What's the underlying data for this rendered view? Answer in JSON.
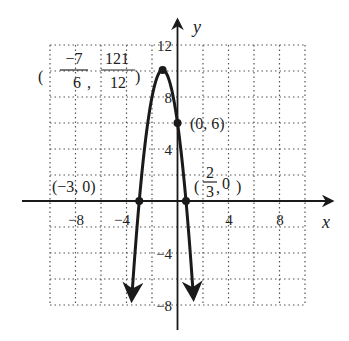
{
  "chart_data": {
    "type": "line",
    "title": "",
    "function": "y = -3x^2 - 7x + 6",
    "xlabel": "x",
    "ylabel": "y",
    "xlim": [
      -10,
      10
    ],
    "ylim": [
      -8,
      12
    ],
    "grid": true,
    "grid_step": 2,
    "x_ticks": [
      {
        "value": -8,
        "label": "−8"
      },
      {
        "value": -4,
        "label": "−4"
      },
      {
        "value": 4,
        "label": "4"
      },
      {
        "value": 8,
        "label": "8"
      }
    ],
    "y_ticks": [
      {
        "value": 12,
        "label": "12"
      },
      {
        "value": 8,
        "label": "8"
      },
      {
        "value": 4,
        "label": "4"
      },
      {
        "value": -4,
        "label": "−4"
      },
      {
        "value": -8,
        "label": "−8"
      }
    ],
    "series": [
      {
        "name": "parabola",
        "x_range": [
          -3.59,
          1.25
        ],
        "coefficients": {
          "a": -3,
          "b": -7,
          "c": 6
        }
      }
    ],
    "points": [
      {
        "name": "vertex",
        "x": -1.1667,
        "y": 10.0833,
        "label_x_num": "−7",
        "label_x_den": "6",
        "label_y_num": "121",
        "label_y_den": "12"
      },
      {
        "name": "y-intercept",
        "x": 0,
        "y": 6,
        "label": "(0, 6)"
      },
      {
        "name": "x-intercept-left",
        "x": -3,
        "y": 0,
        "label": "(−3, 0)"
      },
      {
        "name": "x-intercept-right",
        "x": 0.6667,
        "y": 0,
        "label_x_num": "2",
        "label_x_den": "3",
        "label_y": "0"
      }
    ]
  },
  "colors": {
    "curve": "#1a1a1a",
    "axis": "#1a1a1a",
    "grid": "#555555",
    "background": "#ffffff"
  },
  "labels": {
    "x_axis": "x",
    "y_axis": "y",
    "tick_x_neg8": "−8",
    "tick_x_neg4": "−4",
    "tick_x_4": "4",
    "tick_x_8": "8",
    "tick_y_12": "12",
    "tick_y_8": "8",
    "tick_y_4": "4",
    "tick_y_neg4": "−4",
    "tick_y_neg8": "−8",
    "vertex_x_num": "−7",
    "vertex_x_den": "6",
    "vertex_y_num": "121",
    "vertex_y_den": "12",
    "y_intercept": "(0, 6)",
    "left_root": "(−3, 0)",
    "right_root_num": "2",
    "right_root_den": "3",
    "right_root_y": "0"
  }
}
